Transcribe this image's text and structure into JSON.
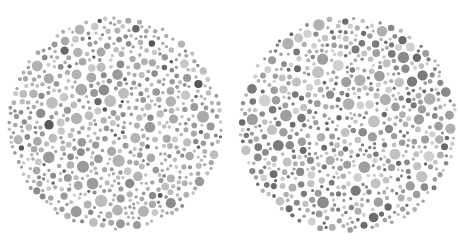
{
  "image": {
    "description": "Two grayscale dot-pattern color-vision test plates side by side",
    "width": 458,
    "height": 246,
    "background": "#ffffff"
  },
  "plates": [
    {
      "name": "left-plate",
      "cx": 115,
      "cy": 124,
      "r": 108,
      "seed": 7,
      "palette": [
        "#bdbdbd",
        "#a9a9a9",
        "#9a9a9a",
        "#8c8c8c",
        "#b3b3b3",
        "#c8c8c8",
        "#6a6a6a",
        "#585858"
      ],
      "weights": [
        18,
        20,
        18,
        12,
        16,
        10,
        4,
        2
      ],
      "min_dot": 1.6,
      "max_dot": 6.2
    },
    {
      "name": "right-plate",
      "cx": 348,
      "cy": 125,
      "r": 110,
      "seed": 19,
      "palette": [
        "#c2c2c2",
        "#b0b0b0",
        "#9e9e9e",
        "#8a8a8a",
        "#7a7a7a",
        "#d0d0d0",
        "#6b6b6b"
      ],
      "weights": [
        16,
        16,
        16,
        14,
        10,
        10,
        8
      ],
      "min_dot": 1.6,
      "max_dot": 6.0
    }
  ]
}
